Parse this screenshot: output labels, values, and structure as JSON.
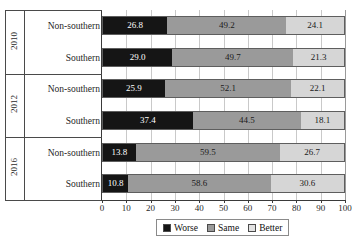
{
  "chart_data": {
    "type": "bar",
    "orientation": "horizontal",
    "stacked": true,
    "stack_mode": "percent",
    "title": "",
    "subtitle": "",
    "xlabel": "",
    "ylabel": "",
    "xlim": [
      0,
      100
    ],
    "xticks": [
      0,
      10,
      20,
      30,
      40,
      50,
      60,
      70,
      80,
      90,
      100
    ],
    "xtick_labels": [
      "0",
      "10",
      "20",
      "30",
      "40",
      "50",
      "60",
      "70",
      "80",
      "90",
      "100"
    ],
    "grid": true,
    "grid_axis": "x",
    "legend_position": "bottom-center",
    "group_field": "year",
    "groups": [
      {
        "label": "2010",
        "rows": [
          {
            "label": "Non-southern",
            "values": [
              26.8,
              49.2,
              24.1
            ]
          },
          {
            "label": "Southern",
            "values": [
              29.0,
              49.7,
              21.3
            ]
          }
        ]
      },
      {
        "label": "2012",
        "rows": [
          {
            "label": "Non-southern",
            "values": [
              25.9,
              52.1,
              22.1
            ]
          },
          {
            "label": "Southern",
            "values": [
              37.4,
              44.5,
              18.1
            ]
          }
        ]
      },
      {
        "label": "2016",
        "rows": [
          {
            "label": "Non-southern",
            "values": [
              13.8,
              59.5,
              26.7
            ]
          },
          {
            "label": "Southern",
            "values": [
              10.8,
              58.6,
              30.6
            ]
          }
        ]
      }
    ],
    "series": [
      {
        "name": "Worse",
        "key": "worse",
        "color": "#151515",
        "values": [
          26.8,
          29.0,
          25.9,
          37.4,
          13.8,
          10.8
        ]
      },
      {
        "name": "Same",
        "key": "same",
        "color": "#9a9a9a",
        "values": [
          49.2,
          49.7,
          52.1,
          44.5,
          59.5,
          58.6
        ]
      },
      {
        "name": "Better",
        "key": "better",
        "color": "#d6d6d6",
        "values": [
          24.1,
          21.3,
          22.1,
          18.1,
          26.7,
          30.6
        ]
      }
    ],
    "data_labels": [
      [
        "26.8",
        "49.2",
        "24.1"
      ],
      [
        "29.0",
        "49.7",
        "21.3"
      ],
      [
        "25.9",
        "52.1",
        "22.1"
      ],
      [
        "37.4",
        "44.5",
        "18.1"
      ],
      [
        "13.8",
        "59.5",
        "26.7"
      ],
      [
        "10.8",
        "58.6",
        "30.6"
      ]
    ]
  },
  "legend": {
    "items": [
      {
        "label": "Worse",
        "key": "worse"
      },
      {
        "label": "Same",
        "key": "same"
      },
      {
        "label": "Better",
        "key": "better"
      }
    ]
  }
}
